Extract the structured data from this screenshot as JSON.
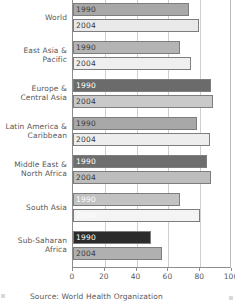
{
  "chart_data": {
    "type": "bar",
    "orientation": "horizontal",
    "title": "",
    "xlabel": "",
    "ylabel": "",
    "xlim": [
      0,
      100
    ],
    "xticks": [
      0,
      20,
      40,
      60,
      80,
      100
    ],
    "grid": true,
    "legend_position": "in-bar",
    "categories": [
      "World",
      "East Asia & Pacific",
      "Europe & Central Asia",
      "Latin America & Caribbean",
      "Middle East & North Africa",
      "South Asia",
      "Sub-Saharan Africa"
    ],
    "series": [
      {
        "name": "1990",
        "values": [
          73,
          67,
          87,
          78,
          84,
          67,
          49
        ]
      },
      {
        "name": "2004",
        "values": [
          79,
          74,
          88,
          86,
          87,
          80,
          56
        ]
      }
    ],
    "bars": [
      {
        "category": "World",
        "label_lines": [
          "World"
        ],
        "color_1990": "#a8a8a8",
        "color_2004": "#e9e9e9",
        "text_1990": "#3a3a3a",
        "text_2004": "#3a3a3a",
        "value_1990": 73,
        "value_2004": 79,
        "label_1990": "1990",
        "label_2004": "2004"
      },
      {
        "category": "East Asia & Pacific",
        "label_lines": [
          "East Asia &",
          "Pacific"
        ],
        "color_1990": "#b4b4b4",
        "color_2004": "#efefef",
        "text_1990": "#3a3a3a",
        "text_2004": "#3a3a3a",
        "value_1990": 67,
        "value_2004": 74,
        "label_1990": "1990",
        "label_2004": "2004"
      },
      {
        "category": "Europe & Central Asia",
        "label_lines": [
          "Europe &",
          "Central Asia"
        ],
        "color_1990": "#6b6b6b",
        "color_2004": "#c9c9c9",
        "text_1990": "#ffffff",
        "text_2004": "#3a3a3a",
        "value_1990": 87,
        "value_2004": 88,
        "label_1990": "1990",
        "label_2004": "2004"
      },
      {
        "category": "Latin America & Caribbean",
        "label_lines": [
          "Latin America &",
          "Caribbean"
        ],
        "color_1990": "#a8a8a8",
        "color_2004": "#ededed",
        "text_1990": "#3a3a3a",
        "text_2004": "#3a3a3a",
        "value_1990": 78,
        "value_2004": 86,
        "label_1990": "1990",
        "label_2004": "2004"
      },
      {
        "category": "Middle East & North Africa",
        "label_lines": [
          "Middle East &",
          "North Africa"
        ],
        "color_1990": "#6e6e6e",
        "color_2004": "#bdbdbd",
        "text_1990": "#ffffff",
        "text_2004": "#3a3a3a",
        "value_1990": 84,
        "value_2004": 87,
        "label_1990": "1990",
        "label_2004": "2004"
      },
      {
        "category": "South Asia",
        "label_lines": [
          "South Asia"
        ],
        "color_1990": "#c2c2c2",
        "color_2004": "#f4f4f4",
        "text_1990": "#ffffff",
        "text_2004": "#ffffff",
        "value_1990": 67,
        "value_2004": 80,
        "label_1990": "1990",
        "label_2004": "2004"
      },
      {
        "category": "Sub-Saharan Africa",
        "label_lines": [
          "Sub-Saharan",
          "Africa"
        ],
        "color_1990": "#2b2b2b",
        "color_2004": "#b0b0b0",
        "text_1990": "#ffffff",
        "text_2004": "#3a3a3a",
        "value_1990": 49,
        "value_2004": 56,
        "label_1990": "1990",
        "label_2004": "2004"
      }
    ]
  },
  "footer": {
    "source": "Source: World Health Organization"
  }
}
